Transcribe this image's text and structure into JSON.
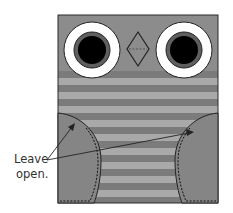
{
  "diagram": {
    "annotation": {
      "line1": "Leave",
      "line2": "open."
    },
    "colors": {
      "background": "#ffffff",
      "body": "#8c8c8c",
      "stripe_dark": "#7b7b7b",
      "stripe_light": "#a9a9a9",
      "pocket": "#858585",
      "eye_white": "#ffffff",
      "iris_ring": "#5f5f5f",
      "pupil": "#000000",
      "outline": "#222222"
    },
    "parts": {
      "body": {
        "x": 58,
        "y": 15,
        "width": 160,
        "height": 188
      },
      "left_eye": {
        "cx": 92,
        "cy": 50,
        "outer_r": 28,
        "iris_r": 18,
        "pupil_r": 14
      },
      "right_eye": {
        "cx": 184,
        "cy": 50,
        "outer_r": 28,
        "iris_r": 18,
        "pupil_r": 14
      },
      "beak": {
        "cx": 138,
        "cy": 49,
        "half_width": 11,
        "half_height": 17
      },
      "stripes": {
        "start_y": 71,
        "stripe_height": 7,
        "count": 19
      },
      "left_pocket": "stitched half-circle, left side",
      "right_pocket": "stitched half-circle, right side"
    }
  }
}
